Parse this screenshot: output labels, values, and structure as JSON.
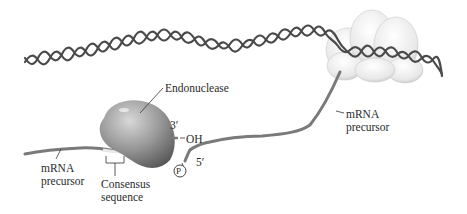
{
  "diagram": {
    "labels": {
      "endonuclease": "Endonuclease",
      "three_prime": "3′",
      "hydroxyl": "OH",
      "five_prime": "5′",
      "phosphate": "P",
      "mrna_left_line1": "mRNA",
      "mrna_left_line2": "precursor",
      "mrna_right_line1": "mRNA",
      "mrna_right_line2": "precursor",
      "consensus_line1": "Consensus",
      "consensus_line2": "sequence"
    },
    "colors": {
      "dna": "#4a4a4a",
      "rna": "#7a7a7a",
      "endonuclease_light": "#bdbdbd",
      "endonuclease_dark": "#5a5a5a",
      "polymerase": "#e6e6e6",
      "text": "#2a2a2a"
    }
  }
}
